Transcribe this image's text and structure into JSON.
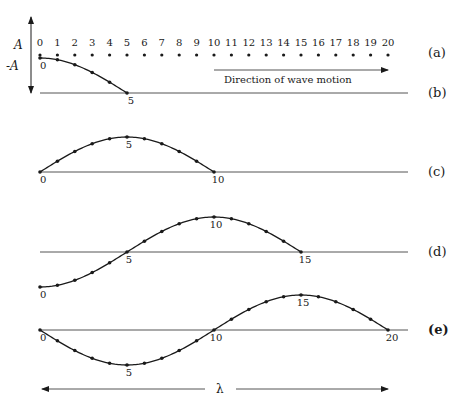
{
  "axis": {
    "A_label": "A",
    "negA_label": "-A"
  },
  "particles": {
    "labels": [
      "0",
      "1",
      "2",
      "3",
      "4",
      "5",
      "6",
      "7",
      "8",
      "9",
      "10",
      "11",
      "12",
      "13",
      "14",
      "15",
      "16",
      "17",
      "18",
      "19",
      "20"
    ]
  },
  "direction": {
    "label": "Direction of wave motion"
  },
  "panels": [
    {
      "id": "a",
      "label": "(a)"
    },
    {
      "id": "b",
      "label": "(b)",
      "point_labels": [
        "0",
        "5"
      ]
    },
    {
      "id": "c",
      "label": "(c)",
      "point_labels": [
        "0",
        "5",
        "10"
      ]
    },
    {
      "id": "d",
      "label": "(d)",
      "point_labels": [
        "0",
        "5",
        "10",
        "15"
      ]
    },
    {
      "id": "e",
      "label": "(e)",
      "point_labels": [
        "0",
        "5",
        "10",
        "15",
        "20"
      ]
    }
  ],
  "wavelength": {
    "label": "λ"
  },
  "colors": {
    "ink": "#1a1a1a",
    "line": "#555555"
  }
}
